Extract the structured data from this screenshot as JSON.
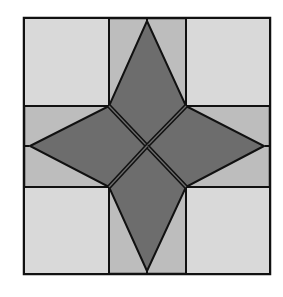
{
  "figure": {
    "colors": {
      "background": "#ffffff",
      "corner_squares": "#d9d9d9",
      "side_panels": "#bdbdbd",
      "star": "#6d6d6d",
      "outline": "#111111"
    }
  }
}
